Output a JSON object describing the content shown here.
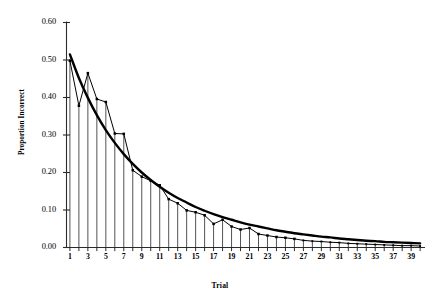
{
  "chart_data": {
    "type": "line",
    "title": "",
    "xlabel": "Trial",
    "ylabel": "Proportion Incorrect",
    "xlim": [
      0.4,
      40.2
    ],
    "ylim": [
      0.0,
      0.6
    ],
    "grid": false,
    "legend": "none",
    "y_ticks": [
      "0.00",
      "0.10",
      "0.20",
      "0.30",
      "0.40",
      "0.50",
      "0.60"
    ],
    "y_tick_values": [
      0.0,
      0.1,
      0.2,
      0.3,
      0.4,
      0.5,
      0.6
    ],
    "x_ticks": [
      "1",
      "3",
      "5",
      "7",
      "9",
      "11",
      "13",
      "15",
      "17",
      "19",
      "21",
      "23",
      "25",
      "27",
      "29",
      "31",
      "33",
      "35",
      "37",
      "39"
    ],
    "x_tick_values": [
      1,
      3,
      5,
      7,
      9,
      11,
      13,
      15,
      17,
      19,
      21,
      23,
      25,
      27,
      29,
      31,
      33,
      35,
      37,
      39
    ],
    "x_minor_ticks": [
      2,
      4,
      6,
      8,
      10,
      12,
      14,
      16,
      18,
      20,
      22,
      24,
      26,
      28,
      30,
      32,
      34,
      36,
      38,
      40
    ],
    "x": [
      1,
      2,
      3,
      4,
      5,
      6,
      7,
      8,
      9,
      10,
      11,
      12,
      13,
      14,
      15,
      16,
      17,
      18,
      19,
      20,
      21,
      22,
      23,
      24,
      25,
      26,
      27,
      28,
      29,
      30,
      31,
      32,
      33,
      34,
      35,
      36,
      37,
      38,
      39,
      40
    ],
    "series": [
      {
        "name": "Observed",
        "style": "line-with-markers-and-droplines",
        "marker": "square",
        "color": "#000000",
        "values": [
          0.498,
          0.378,
          0.465,
          0.396,
          0.388,
          0.304,
          0.303,
          0.206,
          0.189,
          0.178,
          0.166,
          0.129,
          0.118,
          0.099,
          0.094,
          0.086,
          0.063,
          0.074,
          0.056,
          0.048,
          0.052,
          0.036,
          0.032,
          0.028,
          0.026,
          0.023,
          0.019,
          0.017,
          0.016,
          0.014,
          0.013,
          0.011,
          0.01,
          0.009,
          0.008,
          0.007,
          0.006,
          0.005,
          0.005,
          0.004
        ]
      },
      {
        "name": "Fitted",
        "style": "thick-smooth-line",
        "marker": "none",
        "color": "#000000",
        "values": [
          0.515,
          0.452,
          0.399,
          0.353,
          0.313,
          0.279,
          0.249,
          0.223,
          0.2,
          0.18,
          0.162,
          0.146,
          0.132,
          0.12,
          0.108,
          0.098,
          0.089,
          0.081,
          0.074,
          0.067,
          0.061,
          0.056,
          0.051,
          0.046,
          0.042,
          0.038,
          0.035,
          0.032,
          0.029,
          0.027,
          0.024,
          0.022,
          0.02,
          0.018,
          0.017,
          0.015,
          0.014,
          0.013,
          0.012,
          0.011
        ]
      }
    ]
  }
}
